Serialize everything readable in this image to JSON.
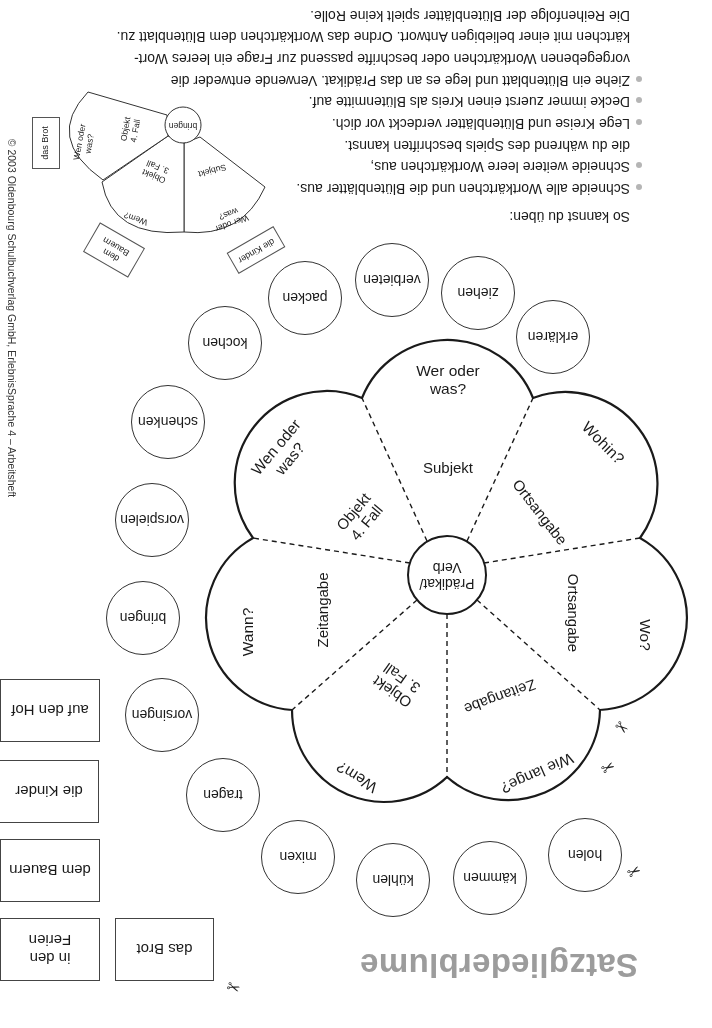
{
  "title": "Satzgliederblume",
  "flower": {
    "center": {
      "line1": "Prädikat/",
      "line2": "Verb",
      "text": "Prädikat/\nVerb"
    },
    "petals": [
      {
        "id": "subjekt",
        "question": "Wer oder\nwas?",
        "label": "Subjekt"
      },
      {
        "id": "ortsangabe-wohin",
        "question": "Wohin?",
        "label": "Ortsangabe"
      },
      {
        "id": "ortsangabe-wo",
        "question": "Wo?",
        "label": "Ortsangabe"
      },
      {
        "id": "zeitangabe-wie-lange",
        "question": "Wie lange?",
        "label": "Zeitangabe"
      },
      {
        "id": "objekt-3",
        "question": "Wem?",
        "label": "Objekt\n3. Fall"
      },
      {
        "id": "zeitangabe-wann",
        "question": "Wann?",
        "label": "Zeitangabe"
      },
      {
        "id": "objekt-4",
        "question": "Wen oder\nwas?",
        "label": "Objekt\n4. Fall"
      }
    ]
  },
  "verb_circles": [
    "erklären",
    "ziehen",
    "verbieten",
    "packen",
    "kochen",
    "schenken",
    "vorspielen",
    "bringen",
    "vorsingen",
    "tragen",
    "mixen",
    "kühlen",
    "kämmen",
    "holen"
  ],
  "word_cards": [
    {
      "text": "auf den Hof"
    },
    {
      "text": "die Kinder"
    },
    {
      "text": "dem Bauern"
    },
    {
      "text": "in den\nFerien"
    },
    {
      "text": "das Brot"
    }
  ],
  "instructions": {
    "heading": "So kannst du üben:",
    "lines": [
      {
        "bullet": true,
        "text": "Schneide alle Wortkärtchen und die Blütenblätter aus."
      },
      {
        "bullet": true,
        "text": "Schneide weitere leere Wortkärtchen aus,"
      },
      {
        "bullet": false,
        "text": "die du während des Spiels beschriften kannst."
      },
      {
        "bullet": true,
        "text": "Lege Kreise und Blütenblätter verdeckt vor dich."
      },
      {
        "bullet": true,
        "text": "Decke immer zuerst einen Kreis als Blütenmitte auf."
      },
      {
        "bullet": true,
        "text": "Ziehe ein Blütenblatt und lege es an das Prädikat. Verwende entweder die"
      },
      {
        "bullet": false,
        "text": "vorgegebenen Wortkärtchen oder beschrifte passend zur Frage ein leeres Wort-"
      },
      {
        "bullet": false,
        "text": "kärtchen mit einer beliebigen Antwort. Ordne das Wortkärtchen dem Blütenblatt zu."
      },
      {
        "bullet": false,
        "text": "Die Reihenfolge der Blütenblätter spielt keine Rolle."
      }
    ]
  },
  "example": {
    "center_verb": "bringen",
    "petals": [
      {
        "label": "Subjekt",
        "question": "Wer oder\nwas?"
      },
      {
        "label": "Objekt\n3. Fall",
        "question": "Wem?"
      },
      {
        "label": "Objekt\n4. Fall",
        "question": "Wen oder\nwas?"
      }
    ],
    "cards": [
      {
        "text": "die Kinder"
      },
      {
        "text": "dem\nBauern"
      },
      {
        "text": "das Brot"
      }
    ]
  },
  "copyright": "© 2003 Oldenbourg Schulbuchverlag GmbH, ErlebnisSprache 4 – Arbeitsheft",
  "icons": {
    "scissors": "✂"
  },
  "colors": {
    "title": "#9c9c9c",
    "line": "#1a1a1a",
    "bullet": "#b5b5b5"
  }
}
